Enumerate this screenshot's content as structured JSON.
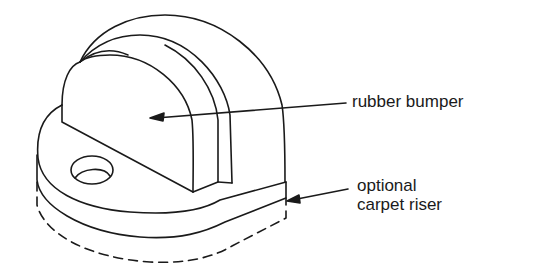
{
  "diagram": {
    "stroke_color": "#1a1a1a",
    "background": "#ffffff",
    "labels": [
      {
        "id": "rubber-bumper",
        "text": "rubber bumper"
      },
      {
        "id": "carpet-riser-line1",
        "text": "optional"
      },
      {
        "id": "carpet-riser-line2",
        "text": "carpet riser"
      }
    ]
  }
}
